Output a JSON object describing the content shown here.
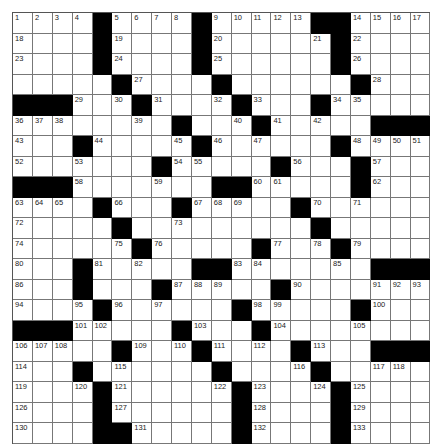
{
  "puzzle": {
    "cols": 21,
    "rows": 21,
    "colors": {
      "block": "#000000",
      "cell": "#ffffff",
      "line": "#777777"
    },
    "legend": "Each row string uses '#' for black squares, '.' for blank white squares, and numbers for numbered white squares.",
    "grid": [
      [
        "1",
        "2",
        "3",
        "4",
        "#",
        "5",
        "6",
        "7",
        "8",
        "#",
        "9",
        "10",
        "11",
        "12",
        "13",
        "#",
        "#",
        "14",
        "15",
        "16",
        "17"
      ],
      [
        "18",
        ".",
        ".",
        ".",
        "#",
        "19",
        ".",
        ".",
        ".",
        "#",
        "20",
        ".",
        ".",
        ".",
        ".",
        "21",
        "#",
        "22",
        ".",
        ".",
        "."
      ],
      [
        "23",
        ".",
        ".",
        ".",
        "#",
        "24",
        ".",
        ".",
        ".",
        "#",
        "25",
        ".",
        ".",
        ".",
        ".",
        ".",
        "#",
        "26",
        ".",
        ".",
        "."
      ],
      [
        ".",
        ".",
        ".",
        ".",
        ".",
        "#",
        "27",
        ".",
        ".",
        ".",
        "#",
        ".",
        ".",
        ".",
        ".",
        ".",
        ".",
        "#",
        "28",
        ".",
        "."
      ],
      [
        "#",
        "#",
        "#",
        "29",
        ".",
        "30",
        "#",
        "31",
        ".",
        ".",
        "32",
        "#",
        "33",
        ".",
        ".",
        "#",
        "34",
        "35",
        ".",
        ".",
        "."
      ],
      [
        "36",
        "37",
        "38",
        ".",
        ".",
        ".",
        "39",
        ".",
        "#",
        ".",
        ".",
        "40",
        "#",
        "41",
        ".",
        "42",
        ".",
        ".",
        "#",
        "#",
        "#"
      ],
      [
        "43",
        ".",
        ".",
        "#",
        "44",
        ".",
        ".",
        ".",
        "45",
        "#",
        "46",
        ".",
        "47",
        ".",
        ".",
        ".",
        "#",
        "48",
        "49",
        "50",
        "51"
      ],
      [
        "52",
        ".",
        ".",
        "53",
        ".",
        ".",
        ".",
        "#",
        "54",
        "55",
        ".",
        ".",
        ".",
        "#",
        "56",
        ".",
        ".",
        "#",
        "57",
        ".",
        "."
      ],
      [
        "#",
        "#",
        "#",
        "58",
        ".",
        ".",
        ".",
        "59",
        ".",
        ".",
        "#",
        "#",
        "60",
        "61",
        ".",
        ".",
        ".",
        "#",
        "62",
        ".",
        "."
      ],
      [
        "63",
        "64",
        "65",
        ".",
        "#",
        "66",
        ".",
        ".",
        "#",
        "67",
        "68",
        "69",
        ".",
        ".",
        "#",
        "70",
        ".",
        "71",
        ".",
        ".",
        "."
      ],
      [
        "72",
        ".",
        ".",
        ".",
        ".",
        "#",
        ".",
        ".",
        "73",
        ".",
        ".",
        ".",
        ".",
        ".",
        ".",
        "#",
        ".",
        ".",
        ".",
        ".",
        "."
      ],
      [
        "74",
        ".",
        ".",
        ".",
        ".",
        "75",
        "#",
        "76",
        ".",
        ".",
        ".",
        ".",
        "#",
        "77",
        ".",
        "78",
        "#",
        "79",
        ".",
        ".",
        "."
      ],
      [
        "80",
        ".",
        ".",
        "#",
        "81",
        ".",
        "82",
        ".",
        ".",
        "#",
        "#",
        "83",
        "84",
        ".",
        ".",
        ".",
        "85",
        ".",
        "#",
        "#",
        "#"
      ],
      [
        "86",
        ".",
        ".",
        "#",
        ".",
        ".",
        ".",
        "#",
        "87",
        "88",
        "89",
        ".",
        ".",
        "#",
        "90",
        ".",
        ".",
        ".",
        "91",
        "92",
        "93"
      ],
      [
        "94",
        ".",
        ".",
        "95",
        "#",
        "96",
        ".",
        "97",
        ".",
        ".",
        ".",
        "#",
        "98",
        "99",
        ".",
        ".",
        ".",
        "#",
        "100",
        ".",
        "."
      ],
      [
        "#",
        "#",
        "#",
        "101",
        "102",
        ".",
        ".",
        ".",
        "#",
        "103",
        ".",
        ".",
        "#",
        "104",
        ".",
        ".",
        ".",
        "105",
        ".",
        ".",
        "."
      ],
      [
        "106",
        "107",
        "108",
        ".",
        ".",
        "#",
        "109",
        ".",
        "110",
        "#",
        "111",
        ".",
        "112",
        ".",
        "#",
        "113",
        ".",
        ".",
        "#",
        "#",
        "#"
      ],
      [
        "114",
        ".",
        ".",
        "#",
        ".",
        "115",
        ".",
        ".",
        ".",
        ".",
        "#",
        ".",
        ".",
        ".",
        "116",
        "#",
        ".",
        ".",
        "117",
        "118",
        "."
      ],
      [
        "119",
        ".",
        ".",
        "120",
        "#",
        "121",
        ".",
        ".",
        ".",
        ".",
        "122",
        "#",
        "123",
        ".",
        ".",
        "124",
        "#",
        "125",
        ".",
        ".",
        "."
      ],
      [
        "126",
        ".",
        ".",
        ".",
        "#",
        "127",
        ".",
        ".",
        ".",
        ".",
        ".",
        "#",
        "128",
        ".",
        ".",
        ".",
        "#",
        "129",
        ".",
        ".",
        "."
      ],
      [
        "130",
        ".",
        ".",
        ".",
        "#",
        "#",
        "131",
        ".",
        ".",
        ".",
        ".",
        "#",
        "132",
        ".",
        ".",
        ".",
        "#",
        "133",
        ".",
        ".",
        "."
      ]
    ]
  }
}
